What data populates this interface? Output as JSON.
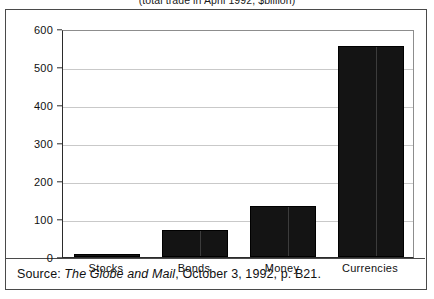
{
  "figure": {
    "title": "(total trade in April 1992, $billion)",
    "source_prefix": "Source:",
    "source_publication": "The Globe and Mail",
    "source_suffix": ", October 3, 1992, p. B21."
  },
  "chart_data": {
    "type": "bar",
    "title": "(total trade in April 1992, $billion)",
    "categories": [
      "Stocks",
      "Bonds",
      "Money",
      "Currencies"
    ],
    "values": [
      8,
      70,
      135,
      555
    ],
    "xlabel": "",
    "ylabel": "",
    "ylim": [
      0,
      600
    ],
    "yticks": [
      0,
      100,
      200,
      300,
      400,
      500,
      600
    ],
    "ytick_labels": [
      "0",
      "100",
      "200",
      "300",
      "400",
      "500",
      "600"
    ],
    "grid": true,
    "legend": false,
    "bar_color": "#141414",
    "units": "$billion",
    "period": "April 1992"
  }
}
